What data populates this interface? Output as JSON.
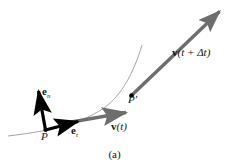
{
  "figure": {
    "caption": "(a)",
    "background_color": "#ffffff",
    "labels": {
      "normal_unit_vector": {
        "symbol": "e",
        "subscript": "n"
      },
      "tangential_unit_vector": {
        "symbol": "e",
        "subscript": "t"
      },
      "velocity_t": {
        "symbol": "v",
        "argument": "(t)"
      },
      "velocity_t_plus_dt": {
        "symbol": "v",
        "argument": "(t + Δt)"
      },
      "point_p": "P",
      "point_p_prime": "P′"
    },
    "colors": {
      "curve": "#8c8c8c",
      "unit_vector": "#000000",
      "velocity_vector": "#6e6e6e",
      "text": "#141414"
    },
    "geometry": {
      "trajectory_curve": "M 8,136 C 40,132 78,126 108,104 C 126,90 136,70 143,45",
      "point_p": [
        45,
        130
      ],
      "point_p_prime": [
        131,
        95
      ],
      "normal_vector_tip": [
        37,
        88
      ],
      "tangential_vector_tip": [
        80,
        121
      ],
      "velocity_t_tip": [
        129,
        112
      ],
      "velocity_t_plus_dt_tip": [
        221,
        10
      ]
    }
  }
}
